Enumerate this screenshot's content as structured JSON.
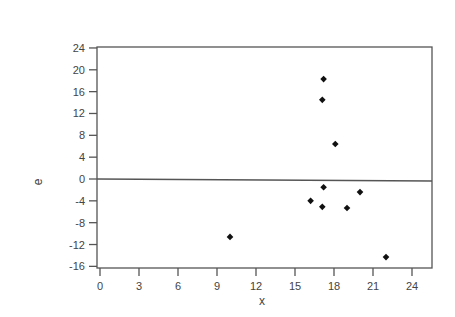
{
  "chart_data": {
    "type": "scatter",
    "title": "",
    "xlabel": "x",
    "ylabel": "e",
    "xlim": [
      -0.2,
      25.6
    ],
    "ylim": [
      -16.3,
      24.2
    ],
    "x_ticks": [
      0,
      3,
      6,
      9,
      12,
      15,
      18,
      21,
      24
    ],
    "y_ticks": [
      24,
      20,
      16,
      12,
      8,
      4,
      0,
      -4,
      -8,
      -12,
      -16
    ],
    "grid": false,
    "legend": null,
    "reference_line": {
      "y": 0
    },
    "marker": "diamond",
    "series": [
      {
        "name": "residuals",
        "points": [
          {
            "x": 17.2,
            "y": 18.3
          },
          {
            "x": 17.1,
            "y": 14.5
          },
          {
            "x": 18.1,
            "y": 6.4
          },
          {
            "x": 17.2,
            "y": -1.5
          },
          {
            "x": 16.2,
            "y": -4.0
          },
          {
            "x": 17.1,
            "y": -5.1
          },
          {
            "x": 19.0,
            "y": -5.3
          },
          {
            "x": 20.0,
            "y": -2.4
          },
          {
            "x": 10.0,
            "y": -10.6
          },
          {
            "x": 22.0,
            "y": -14.3
          }
        ]
      }
    ]
  },
  "colors": {
    "frame": "#555555",
    "marker": "#111111",
    "text": "#444444"
  }
}
